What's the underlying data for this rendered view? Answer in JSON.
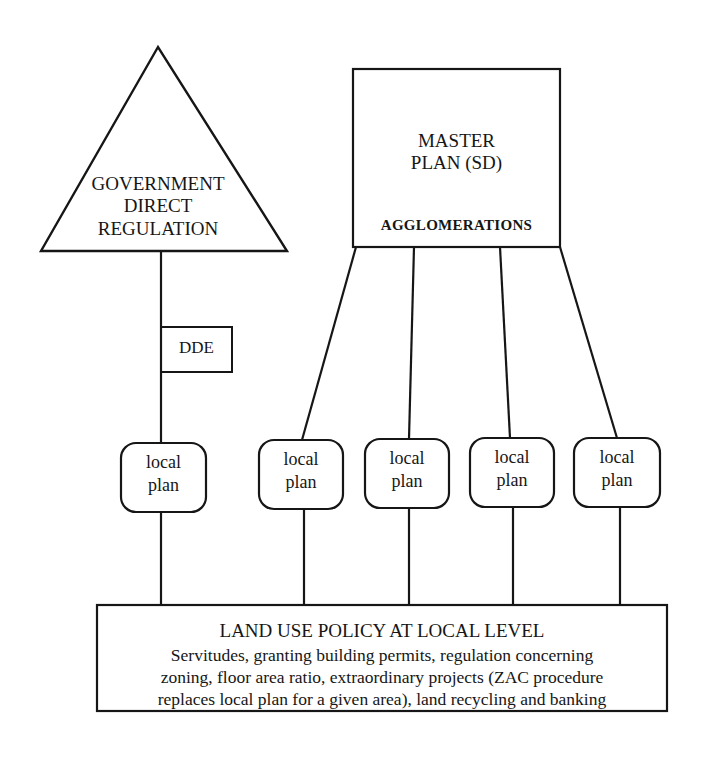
{
  "diagram": {
    "government": {
      "shape": "triangle",
      "lines": [
        "GOVERNMENT",
        "DIRECT",
        "REGULATION"
      ]
    },
    "dde": {
      "label": "DDE"
    },
    "master_plan": {
      "lines": [
        "MASTER",
        "PLAN (SD)"
      ],
      "sublabel": "AGGLOMERATIONS"
    },
    "local_plans": [
      {
        "line1": "local",
        "line2": "plan"
      },
      {
        "line1": "local",
        "line2": "plan"
      },
      {
        "line1": "local",
        "line2": "plan"
      },
      {
        "line1": "local",
        "line2": "plan"
      },
      {
        "line1": "local",
        "line2": "plan"
      }
    ],
    "land_use": {
      "title": "LAND USE POLICY AT LOCAL LEVEL",
      "lines": [
        "Servitudes, granting building permits, regulation concerning",
        "zoning, floor area ratio, extraordinary projects (ZAC procedure",
        "replaces local plan for a given area), land recycling and banking"
      ]
    },
    "colors": {
      "stroke": "#161616",
      "background": "#ffffff"
    }
  }
}
